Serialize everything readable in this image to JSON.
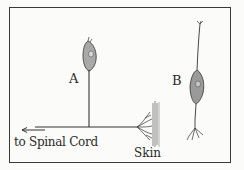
{
  "diagram": {
    "type": "neuron illustration",
    "labels": {
      "neuron_a": "A",
      "neuron_b": "B",
      "direction": "to Spinal Cord",
      "skin": "Skin"
    },
    "colors": {
      "ink": "#2a2a2a",
      "background": "#fbfbf9",
      "cell_shade": "#9a9a9a"
    }
  }
}
